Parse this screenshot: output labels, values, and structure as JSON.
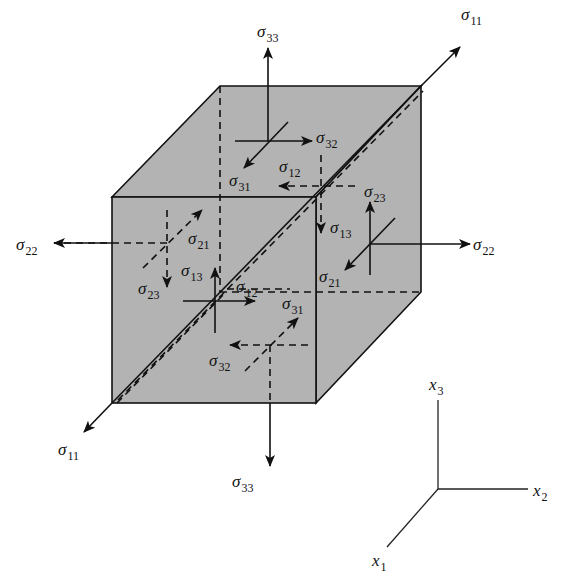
{
  "figure": {
    "stress_labels": {
      "s11_top": {
        "symbol": "σ",
        "sub": "11"
      },
      "s11_bottom": {
        "symbol": "σ",
        "sub": "11"
      },
      "s33_top": {
        "symbol": "σ",
        "sub": "33"
      },
      "s33_bottom": {
        "symbol": "σ",
        "sub": "33"
      },
      "s22_left": {
        "symbol": "σ",
        "sub": "22"
      },
      "s22_right": {
        "symbol": "σ",
        "sub": "22"
      },
      "s32_top": {
        "symbol": "σ",
        "sub": "32"
      },
      "s31_top": {
        "symbol": "σ",
        "sub": "31"
      },
      "s12_back": {
        "symbol": "σ",
        "sub": "12"
      },
      "s23_back": {
        "symbol": "σ",
        "sub": "23"
      },
      "s13_back": {
        "symbol": "σ",
        "sub": "13"
      },
      "s23_right": {
        "symbol": "σ",
        "sub": "23"
      },
      "s21_right": {
        "symbol": "σ",
        "sub": "21"
      },
      "s21_left": {
        "symbol": "σ",
        "sub": "21"
      },
      "s23_left": {
        "symbol": "σ",
        "sub": "23"
      },
      "s13_front": {
        "symbol": "σ",
        "sub": "13"
      },
      "s12_front": {
        "symbol": "σ",
        "sub": "12"
      },
      "s31_bottom": {
        "symbol": "σ",
        "sub": "31"
      },
      "s32_bottom": {
        "symbol": "σ",
        "sub": "32"
      }
    },
    "axes": {
      "x1": {
        "symbol": "x",
        "sub": "1"
      },
      "x2": {
        "symbol": "x",
        "sub": "2"
      },
      "x3": {
        "symbol": "x",
        "sub": "3"
      }
    },
    "colors": {
      "face": "#b3b3b3",
      "ink": "#111111"
    }
  }
}
